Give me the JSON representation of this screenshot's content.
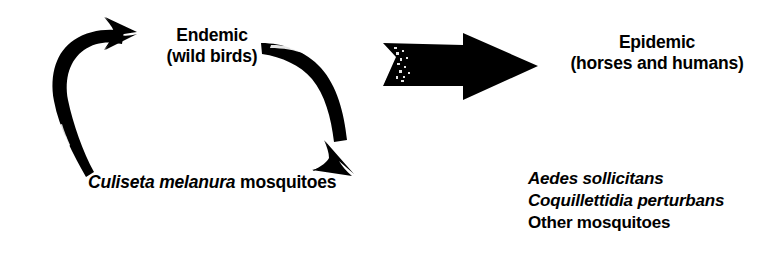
{
  "diagram": {
    "background_color": "#ffffff",
    "ink_color": "#000000",
    "nodes": {
      "endemic": {
        "line1": "Endemic",
        "line2": "(wild birds)"
      },
      "epidemic": {
        "line1": "Epidemic",
        "line2": "(horses and humans)"
      }
    },
    "enzootic_vector": {
      "species": "Culiseta melanura",
      "suffix": "mosquitoes"
    },
    "bridge_vectors": {
      "items": [
        {
          "text": "Aedes sollicitans",
          "style": "italic"
        },
        {
          "text": "Coquillettidia perturbans",
          "style": "italic"
        },
        {
          "text": "Other mosquitoes",
          "style": "plain"
        }
      ]
    },
    "arrows": [
      {
        "name": "cycle-arrow-left",
        "direction": "up-right",
        "description": "curved arrow from mosquitoes to endemic birds"
      },
      {
        "name": "cycle-arrow-right",
        "direction": "down-left",
        "description": "curved arrow from endemic birds to mosquitoes"
      },
      {
        "name": "spillover-arrow",
        "direction": "right",
        "description": "thick block arrow from endemic cycle to epidemic"
      }
    ]
  }
}
